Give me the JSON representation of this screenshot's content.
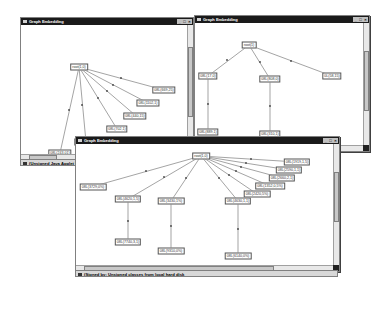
{
  "windows": [
    {
      "id": "win1",
      "title": "Graph Embedding",
      "controls": [
        "_",
        "□",
        "×"
      ],
      "status": "(Unsigned Java Applet Window)",
      "nodes": [
        {
          "label": "root(1,0)"
        },
        {
          "label": "08L(669,25)"
        },
        {
          "label": "08L(1102,1)"
        },
        {
          "label": "08L(440,15)"
        },
        {
          "label": "08L(702,1)"
        },
        {
          "label": "08L(448,18)"
        },
        {
          "label": "08L(243,01)"
        }
      ]
    },
    {
      "id": "win2",
      "title": "Graph Embedding",
      "controls": [
        "_",
        "□",
        "×"
      ],
      "nodes": [
        {
          "label": "root(1)"
        },
        {
          "label": "08L(17,0)"
        },
        {
          "label": "08L(808,0)"
        },
        {
          "label": "0L(58,15)"
        },
        {
          "label": "08L(889,1)"
        },
        {
          "label": "08L(310,1)"
        }
      ]
    },
    {
      "id": "win3",
      "title": "Graph Embedding",
      "controls": [
        "_",
        "□",
        "×"
      ],
      "status": "(Signed by: Unsigned classes from local hard disk",
      "nodes": [
        {
          "label": "root(1,0)"
        },
        {
          "label": "08L(1919,1,5)"
        },
        {
          "label": "08L(2590,1,1)"
        },
        {
          "label": "08L(2660,2,1)"
        },
        {
          "label": "08L(1352,0,5%)"
        },
        {
          "label": "08L(2420,5%)"
        },
        {
          "label": "08L(3729,0%)"
        },
        {
          "label": "08L(4620,1,5)"
        },
        {
          "label": "08L(3430,1%)"
        },
        {
          "label": "08L(4630,1,1)"
        },
        {
          "label": "08L(7740,3,1)"
        },
        {
          "label": "08L(9310,0%)"
        },
        {
          "label": "08L(6140,0%)"
        }
      ]
    }
  ]
}
